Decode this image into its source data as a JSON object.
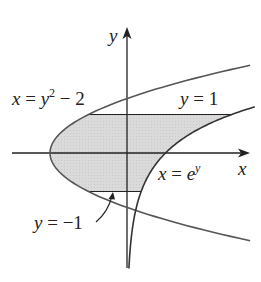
{
  "figure": {
    "axes": {
      "x_label": "x",
      "y_label": "y"
    },
    "curves": [
      {
        "id": "parabola",
        "label_lhs": "x",
        "label_eq": " = ",
        "label_var": "y",
        "label_exp": "2",
        "label_tail": " − 2"
      },
      {
        "id": "exponential",
        "label_lhs": "x",
        "label_eq": " = ",
        "label_base": "e",
        "label_exp": "y"
      }
    ],
    "lines": [
      {
        "id": "upper",
        "label_var": "y",
        "label_rest": " = 1"
      },
      {
        "id": "lower",
        "label_var": "y",
        "label_rest": " = −1"
      }
    ],
    "colors": {
      "region_fill": "#d9d9d9",
      "curve": "#555555",
      "axis": "#222222"
    }
  }
}
